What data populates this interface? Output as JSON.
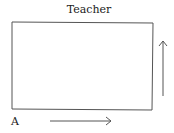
{
  "diagram": {
    "title": "Teacher",
    "corner_label": "A",
    "shapes": {
      "rectangle": {
        "x": 12,
        "y": 22,
        "width": 141,
        "height": 88,
        "stroke": "#555555"
      },
      "arrow_bottom": {
        "direction": "right",
        "x1": 50,
        "y1": 121,
        "x2": 111,
        "y2": 121
      },
      "arrow_right": {
        "direction": "up",
        "x1": 163,
        "y1": 96,
        "x2": 163,
        "y2": 41
      }
    }
  }
}
